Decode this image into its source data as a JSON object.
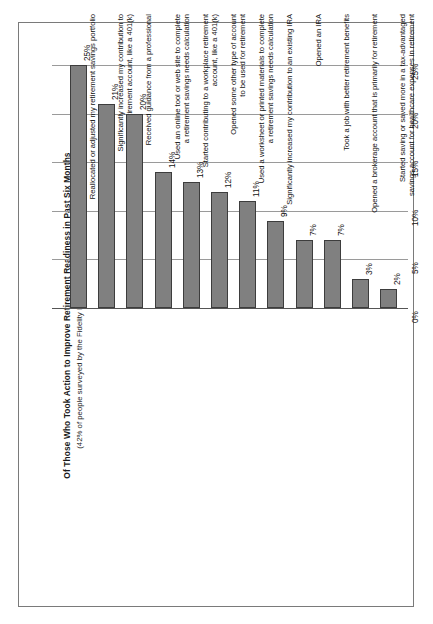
{
  "chart_data": {
    "type": "bar",
    "title": "Of Those Who Took Action to Improve Retirement Readiness in Past Six Months",
    "subtitle": "(42% of people surveyed by the Fidelity Investments Retirement Index, 2007)",
    "xlabel": "",
    "ylabel": "",
    "ylim": [
      0,
      27
    ],
    "grid": true,
    "legend": "none",
    "orientation": "rotated-90",
    "tick_labels": [
      "0%",
      "5%",
      "10%",
      "15%",
      "20%",
      "25%"
    ],
    "tick_values": [
      0,
      5,
      10,
      15,
      20,
      25
    ],
    "categories": [
      "Reallocated or adjusted my retirement savings portfolio",
      "Significantly increased my contribution to an existing workplace retirement account, like a 401(k)",
      "Received guidance from a professional",
      "Used an online tool or web site to complete a retirement savings needs calculation",
      "Started contributing to a workplace retirement account, like a 401(k)",
      "Opened some other type of account to be used for retirement",
      "Used a worksheet or printed materials to complete a retirement savings needs calculation",
      "Significantly increased my contribution to an existing IRA",
      "Opened an IRA",
      "Took a job with better retirement benefits",
      "Opened a brokerage account that is primarily for retirement",
      "Started saving or saved more in a tax-advantaged savings account for healthcare expenses in retirement"
    ],
    "category_lines": [
      [
        "Reallocated or adjusted my retirement savings portfolio"
      ],
      [
        "Significantly increased my contribution to",
        "an existing workplace retirement account, like a 401(k)"
      ],
      [
        "Received guidance from a professional"
      ],
      [
        "Used an online tool or web site to complete",
        "a retirement savings needs calculation"
      ],
      [
        "Started contributing to a workplace retirement",
        "account, like a 401(k)"
      ],
      [
        "Opened some other type of account",
        "to be used for retirement"
      ],
      [
        "Used a worksheet or printed materials to complete",
        "a retirement savings needs calculation"
      ],
      [
        "Significantly increased my contribution to an existing IRA"
      ],
      [
        "Opened an IRA"
      ],
      [
        "Took a job with better retirement benefits"
      ],
      [
        "Opened a brokerage account that is primarily for retirement"
      ],
      [
        "Started saving or saved more in a tax-advantaged",
        "savings account for healthcare expenses in retirement"
      ]
    ],
    "values": [
      25,
      21,
      20,
      14,
      13,
      12,
      11,
      9,
      7,
      7,
      3,
      2
    ],
    "value_labels": [
      "25%",
      "21%",
      "20%",
      "14%",
      "13%",
      "12%",
      "11%",
      "9%",
      "7%",
      "7%",
      "3%",
      "2%"
    ],
    "colors": {
      "bar_fill": "#808080",
      "bar_stroke": "#3d3d3d",
      "gridline": "#9a9a9a",
      "frame": "#7a7a7a",
      "text": "#111111",
      "background": "#ffffff"
    }
  }
}
